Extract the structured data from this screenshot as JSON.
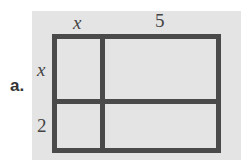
{
  "problem_label": "a.",
  "top_labels": [
    "x",
    "5"
  ],
  "side_labels": [
    "x",
    "2"
  ]
}
